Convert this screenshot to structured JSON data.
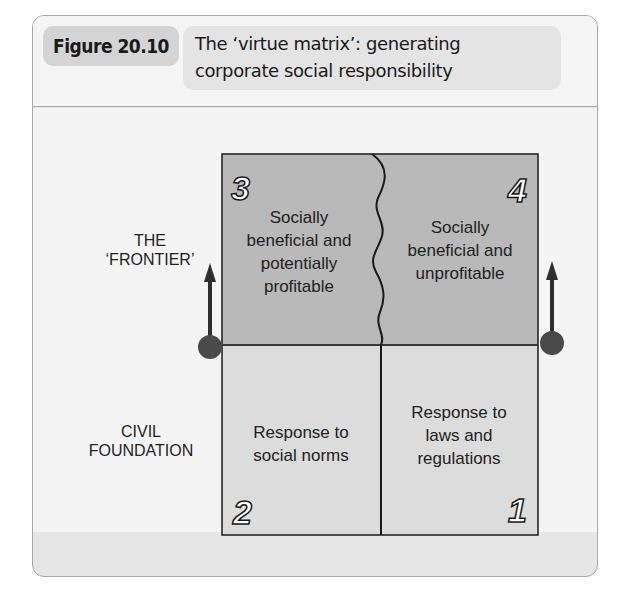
{
  "figure": {
    "label": "Figure 20.10",
    "title_line1": "The ‘virtue matrix’: generating",
    "title_line2": "corporate social responsibility"
  },
  "side_labels": {
    "frontier_line1": "THE",
    "frontier_line2": "‘FRONTIER’",
    "civil_line1": "CIVIL",
    "civil_line2": "FOUNDATION"
  },
  "quadrants": [
    {
      "number": "3",
      "position": "top-left",
      "lines": [
        "Socially",
        "beneficial and",
        "potentially",
        "profitable"
      ],
      "fill": "#b9b9b9"
    },
    {
      "number": "4",
      "position": "top-right",
      "lines": [
        "Socially",
        "beneficial and",
        "unprofitable"
      ],
      "fill": "#b9b9b9"
    },
    {
      "number": "2",
      "position": "bottom-left",
      "lines": [
        "Response to",
        "social norms"
      ],
      "fill": "#dcdcdc"
    },
    {
      "number": "1",
      "position": "bottom-right",
      "lines": [
        "Response to",
        "laws and",
        "regulations"
      ],
      "fill": "#dcdcdc"
    }
  ],
  "colors": {
    "frontier_fill": "#b9b9b9",
    "foundation_fill": "#dcdcdc",
    "marker": "#4a4a4a",
    "line": "#1a1a1a"
  }
}
